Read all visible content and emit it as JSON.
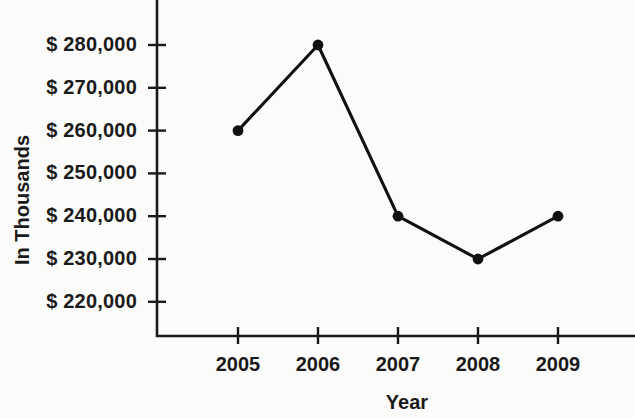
{
  "chart_data": {
    "type": "line",
    "title": "",
    "xlabel": "Year",
    "ylabel": "In Thousands",
    "categories": [
      "2005",
      "2006",
      "2007",
      "2008",
      "2009"
    ],
    "values": [
      260000,
      280000,
      240000,
      230000,
      240000
    ],
    "series": [
      {
        "name": "",
        "values": [
          260000,
          280000,
          240000,
          230000,
          240000
        ]
      }
    ],
    "ytick_labels": [
      "$ 280,000",
      "$ 270,000",
      "$ 260,000",
      "$ 250,000",
      "$ 240,000",
      "$ 230,000",
      "$ 220,000"
    ],
    "ytick_values": [
      280000,
      270000,
      260000,
      250000,
      240000,
      230000,
      220000
    ],
    "xtick_labels": [
      "2005",
      "2006",
      "2007",
      "2008",
      "2009"
    ],
    "ylim": [
      215000,
      287000
    ],
    "grid": false,
    "legend": false,
    "legend_position": "none",
    "line_color": "#111111",
    "marker_color": "#111111",
    "axis_color": "#1a1a1a",
    "background_color": "#fbfbf9"
  }
}
